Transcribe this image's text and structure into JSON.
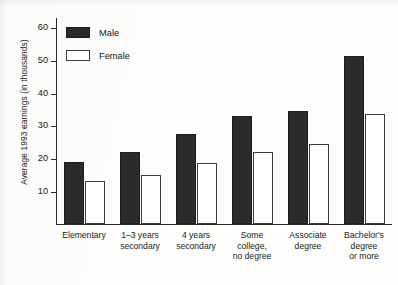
{
  "chart_data": {
    "type": "bar",
    "title": "",
    "xlabel": "",
    "ylabel": "Average 1993 earnings (in thousands)",
    "ylim": [
      0,
      63
    ],
    "yticks": [
      10,
      20,
      30,
      40,
      50,
      60
    ],
    "ytick_labels": [
      "10",
      "20",
      "30",
      "40",
      "50",
      "60"
    ],
    "grid": false,
    "legend_position": "upper-left-inside",
    "categories": [
      "Elementary",
      "1–3 years\nsecondary",
      "4 years\nsecondary",
      "Some\ncollege,\nno degree",
      "Associate\ndegree",
      "Bachelor's\ndegree\nor more"
    ],
    "series": [
      {
        "name": "Male",
        "color": "#2b2b2b",
        "values": [
          19,
          22,
          27.5,
          33,
          34.5,
          51
        ]
      },
      {
        "name": "Female",
        "color": "#ffffff",
        "values": [
          13,
          15,
          18.5,
          22,
          24.5,
          33.5
        ]
      }
    ]
  }
}
